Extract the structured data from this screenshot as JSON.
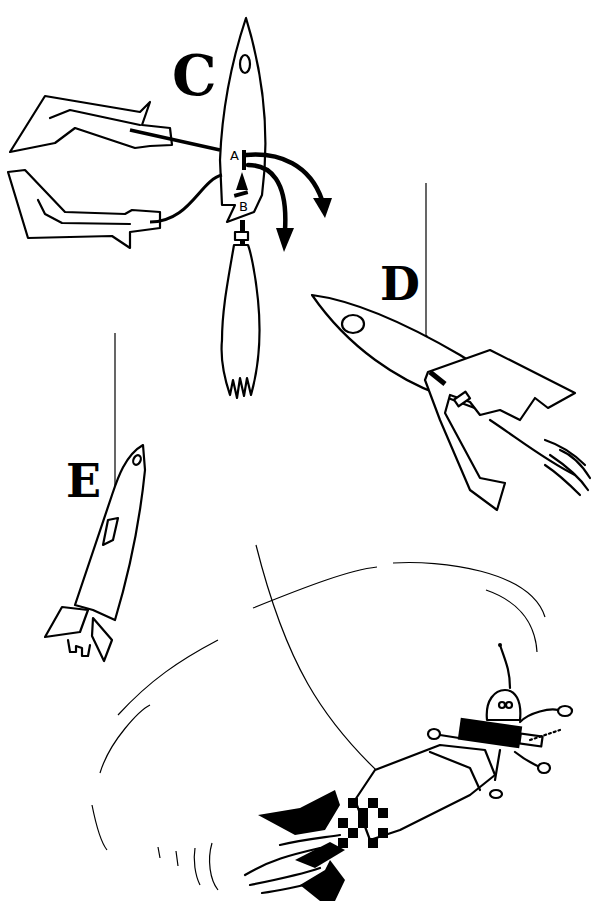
{
  "figure": {
    "title": "",
    "background": "#ffffff",
    "ink": "#000000",
    "panels": [
      {
        "id": "C",
        "label": "C",
        "description": "Upright rocket with two glider wings attached by lines; labeled parts A and B with curved arrows"
      },
      {
        "id": "D",
        "label": "D",
        "description": "Rocket tilted down-right with glider attached, hanging from a thread"
      },
      {
        "id": "E",
        "label": "E",
        "description": "Slender rocket tilted hanging from a thread"
      },
      {
        "id": "F",
        "label": "",
        "description": "Cartoon rocket with astronaut in dome spinning on a string in circular motion"
      }
    ],
    "part_labels": {
      "a": "A",
      "b": "B"
    }
  }
}
